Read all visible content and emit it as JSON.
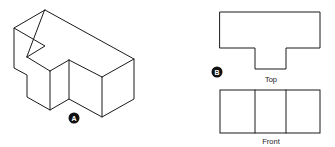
{
  "figure": {
    "ink_color": "#1a1a1a",
    "background": "#ffffff"
  },
  "isometric_view": {
    "badge": "A",
    "outline_points": "45,10 134,59 134,99 102,117 69,99 50,110 27,97 27,75 14,68 14,28 45,46 27,57",
    "edges": [
      "14,28 45,10",
      "27,57 50,71",
      "50,71 50,110",
      "50,71 69,60",
      "69,60 69,99",
      "69,60 102,77",
      "102,77 134,59",
      "102,77 102,117"
    ]
  },
  "orthographic_views": {
    "badge": "B",
    "top_view": {
      "label": "Top",
      "outline_points": "220,12 320,12 320,48 286,48 286,69 255,69 255,48 220,48"
    },
    "front_view": {
      "label": "Front",
      "rect": {
        "x": 220,
        "y": 90,
        "w": 100,
        "h": 43
      },
      "dividers_x": [
        255,
        286
      ]
    }
  }
}
